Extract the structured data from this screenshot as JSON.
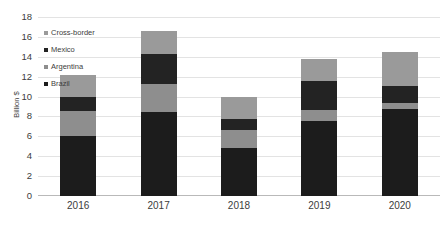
{
  "chart_data": {
    "type": "bar",
    "stacked": true,
    "title": "",
    "xlabel": "",
    "ylabel": "Billion $",
    "ylim": [
      0,
      18
    ],
    "ytick_step": 2,
    "yticks": [
      0,
      2,
      4,
      6,
      8,
      10,
      12,
      14,
      16,
      18
    ],
    "grid": true,
    "legend_position": "upper-left-inside",
    "categories": [
      "2016",
      "2017",
      "2018",
      "2019",
      "2020"
    ],
    "series": [
      {
        "name": "Brazil",
        "color": "#1c1c1c",
        "values": [
          6.0,
          8.4,
          4.8,
          7.5,
          8.8
        ]
      },
      {
        "name": "Argentina",
        "color": "#8e8e8e",
        "values": [
          2.5,
          2.9,
          1.8,
          1.1,
          0.6
        ]
      },
      {
        "name": "Mexico",
        "color": "#232323",
        "values": [
          1.5,
          3.0,
          1.1,
          3.0,
          1.7
        ]
      },
      {
        "name": "Cross-border",
        "color": "#9a9a9a",
        "values": [
          2.2,
          2.3,
          2.3,
          2.2,
          3.4
        ]
      }
    ],
    "totals": [
      12.2,
      16.6,
      10.0,
      13.8,
      14.5
    ],
    "legend_order": [
      "Cross-border",
      "Mexico",
      "Argentina",
      "Brazil"
    ]
  },
  "axis": {
    "y_title": "Billion $",
    "y_tick_labels": [
      "18",
      "16",
      "14",
      "12",
      "10",
      "8",
      "6",
      "4",
      "2",
      "0"
    ],
    "x_tick_labels": [
      "2016",
      "2017",
      "2018",
      "2019",
      "2020"
    ]
  },
  "legend": {
    "items": [
      {
        "label": "Cross-border",
        "color": "#9a9a9a"
      },
      {
        "label": "Mexico",
        "color": "#232323"
      },
      {
        "label": "Argentina",
        "color": "#8e8e8e"
      },
      {
        "label": "Brazil",
        "color": "#1c1c1c"
      }
    ]
  }
}
